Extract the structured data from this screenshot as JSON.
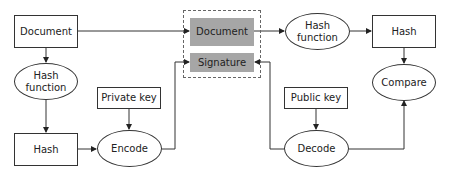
{
  "diagram": {
    "nodes": {
      "document_src": {
        "label": "Document",
        "shape": "rectangle"
      },
      "hash_function_left": {
        "label": "Hash\nfunction",
        "line1": "Hash",
        "line2": "function",
        "shape": "ellipse"
      },
      "hash_left": {
        "label": "Hash",
        "shape": "rectangle"
      },
      "private_key": {
        "label": "Private key",
        "shape": "rectangle"
      },
      "encode": {
        "label": "Encode",
        "shape": "ellipse"
      },
      "signed_document": {
        "label": "Document",
        "shape": "rectangle",
        "fill": "#a6a6a6"
      },
      "signature": {
        "label": "Signature",
        "shape": "rectangle",
        "fill": "#a6a6a6"
      },
      "hash_function_right": {
        "label": "Hash\nfunction",
        "line1": "Hash",
        "line2": "function",
        "shape": "ellipse"
      },
      "hash_right": {
        "label": "Hash",
        "shape": "rectangle"
      },
      "public_key": {
        "label": "Public key",
        "shape": "rectangle"
      },
      "decode": {
        "label": "Decode",
        "shape": "ellipse"
      },
      "compare": {
        "label": "Compare",
        "shape": "ellipse"
      }
    },
    "group": {
      "name": "signed-message",
      "style": "dashed",
      "contains": [
        "signed_document",
        "signature"
      ]
    },
    "edges": [
      {
        "from": "document_src",
        "to": "signed_document"
      },
      {
        "from": "document_src",
        "to": "hash_function_left"
      },
      {
        "from": "hash_function_left",
        "to": "hash_left"
      },
      {
        "from": "hash_left",
        "to": "encode"
      },
      {
        "from": "private_key",
        "to": "encode"
      },
      {
        "from": "encode",
        "to": "signature"
      },
      {
        "from": "signed_document",
        "to": "hash_function_right"
      },
      {
        "from": "hash_function_right",
        "to": "hash_right"
      },
      {
        "from": "hash_right",
        "to": "compare"
      },
      {
        "from": "public_key",
        "to": "decode"
      },
      {
        "from": "signature",
        "to": "decode"
      },
      {
        "from": "decode",
        "to": "compare"
      }
    ],
    "colors": {
      "stroke": "#333333",
      "gray_fill": "#a6a6a6",
      "dashed_border": "#666666"
    }
  }
}
